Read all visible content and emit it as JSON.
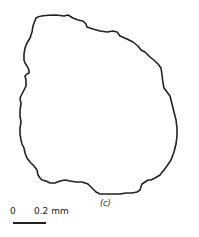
{
  "figure": {
    "panel_label": "(c)",
    "scale": {
      "zero_label": "0",
      "value_label": "0.2 mm"
    },
    "outline": {
      "stroke_color": "#222222",
      "description": "irregular closed grain outline"
    }
  }
}
